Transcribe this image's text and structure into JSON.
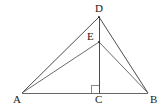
{
  "figure": {
    "background_color": "#ffffff",
    "line_color": "#4d4d4d",
    "baseline_color": "#666666",
    "label_color": "#1a1a1a",
    "width": 168,
    "height": 112
  },
  "points": {
    "A": {
      "label": "A",
      "x": 22,
      "y": 93
    },
    "B": {
      "label": "B",
      "x": 148,
      "y": 93
    },
    "C": {
      "label": "C",
      "x": 99,
      "y": 93
    },
    "D": {
      "label": "D",
      "x": 99,
      "y": 17
    },
    "E": {
      "label": "E",
      "x": 99,
      "y": 42
    }
  },
  "segments": [
    {
      "name": "AB",
      "from": "A",
      "to": "B",
      "x1": 22,
      "y1": 93,
      "x2": 148,
      "y2": 93
    },
    {
      "name": "AD",
      "from": "A",
      "to": "D",
      "x1": 22,
      "y1": 93,
      "x2": 99,
      "y2": 17
    },
    {
      "name": "BD",
      "from": "B",
      "to": "D",
      "x1": 148,
      "y1": 93,
      "x2": 99,
      "y2": 17
    },
    {
      "name": "AE",
      "from": "A",
      "to": "E",
      "x1": 22,
      "y1": 93,
      "x2": 99,
      "y2": 42
    },
    {
      "name": "BE",
      "from": "B",
      "to": "E",
      "x1": 148,
      "y1": 93,
      "x2": 99,
      "y2": 42
    },
    {
      "name": "DC",
      "from": "D",
      "to": "C",
      "x1": 99,
      "y1": 17,
      "x2": 99,
      "y2": 93
    }
  ],
  "right_angle_marker": {
    "name": "right-angle-at-C",
    "at_point": "C",
    "size": 8,
    "path": "M 91 93 L 91 85 L 99 85"
  }
}
